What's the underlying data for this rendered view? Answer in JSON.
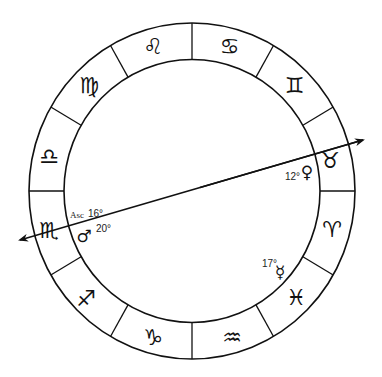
{
  "diagram": {
    "type": "astrological-chart-wheel",
    "colors": {
      "stroke": "#111111",
      "background": "#ffffff"
    },
    "signs": [
      {
        "name": "Cancer",
        "glyph": "♋"
      },
      {
        "name": "Gemini",
        "glyph": "♊"
      },
      {
        "name": "Taurus",
        "glyph": "♉"
      },
      {
        "name": "Aries",
        "glyph": "♈"
      },
      {
        "name": "Pisces",
        "glyph": "♓"
      },
      {
        "name": "Aquarius",
        "glyph": "♒"
      },
      {
        "name": "Capricorn",
        "glyph": "♑"
      },
      {
        "name": "Sagittarius",
        "glyph": "♐"
      },
      {
        "name": "Scorpio",
        "glyph": "♏"
      },
      {
        "name": "Libra",
        "glyph": "♎"
      },
      {
        "name": "Virgo",
        "glyph": "♍"
      },
      {
        "name": "Leo",
        "glyph": "♌"
      }
    ],
    "ascendant": {
      "label": "Asc",
      "degree": "16°"
    },
    "planets": [
      {
        "name": "Mars",
        "glyph": "♂",
        "degree": "20°"
      },
      {
        "name": "Venus",
        "glyph": "♀",
        "degree": "12°"
      },
      {
        "name": "Mercury",
        "glyph": "☿",
        "degree": "17°"
      }
    ]
  }
}
